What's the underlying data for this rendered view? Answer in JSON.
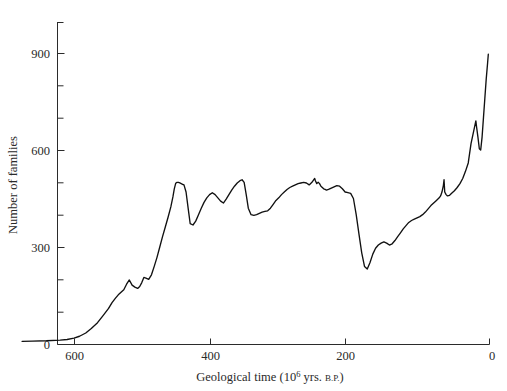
{
  "chart_data": {
    "type": "line",
    "title": "",
    "subtitle": "",
    "xlabel": "Geological time (10^6 yrs. B.P.)",
    "xlabel_main": "Geological time (10",
    "xlabel_exponent": "6",
    "xlabel_mid": " yrs. ",
    "xlabel_smallcaps": "B.P.",
    "xlabel_end": ")",
    "ylabel": "Number of families",
    "grid": false,
    "legend": null,
    "xlim": [
      680,
      0
    ],
    "ylim": [
      0,
      1000
    ],
    "x_axis_inverted": true,
    "xticks": [
      600,
      400,
      200,
      0
    ],
    "xtick_labels": [
      "600",
      "400",
      "200",
      "0"
    ],
    "x_minor_tick_interval": 0,
    "yticks": [
      0,
      300,
      600,
      900
    ],
    "ytick_labels": [
      "0",
      "300",
      "600",
      "900"
    ],
    "y_minor_ticks": [
      100,
      200,
      400,
      500,
      700,
      800,
      1000
    ],
    "series_name": "Number of marine + continental animal families",
    "x": [
      675,
      660,
      640,
      620,
      610,
      600,
      592,
      583,
      575,
      566,
      558,
      550,
      545,
      540,
      536,
      532,
      528,
      524,
      520,
      516,
      512,
      508,
      505,
      502,
      499,
      496,
      492,
      488,
      484,
      480,
      476,
      472,
      468,
      464,
      460,
      457,
      455,
      453,
      451,
      449,
      447,
      445,
      443,
      441,
      438,
      435,
      432,
      428,
      424,
      420,
      416,
      412,
      408,
      404,
      400,
      396,
      392,
      388,
      384,
      380,
      376,
      372,
      368,
      364,
      360,
      357,
      354,
      351,
      348,
      344,
      340,
      336,
      332,
      328,
      324,
      320,
      316,
      312,
      308,
      304,
      300,
      296,
      292,
      288,
      284,
      280,
      276,
      272,
      268,
      264,
      260,
      256,
      252,
      251,
      249,
      247,
      245,
      243,
      241,
      239,
      237,
      235,
      232,
      228,
      224,
      220,
      216,
      212,
      208,
      204,
      200,
      196,
      192,
      188,
      184,
      180,
      176,
      172,
      168,
      164,
      160,
      156,
      152,
      148,
      144,
      140,
      136,
      132,
      128,
      124,
      120,
      116,
      112,
      108,
      104,
      100,
      96,
      92,
      88,
      84,
      80,
      76,
      72,
      70,
      68,
      66,
      65,
      64,
      62,
      60,
      57,
      54,
      50,
      46,
      42,
      38,
      34,
      30,
      26,
      22,
      18,
      14,
      10,
      6,
      3,
      1
    ],
    "y": [
      8,
      9,
      10,
      12,
      14,
      18,
      24,
      34,
      48,
      66,
      88,
      110,
      128,
      142,
      152,
      160,
      168,
      185,
      198,
      182,
      176,
      172,
      178,
      190,
      206,
      204,
      200,
      214,
      240,
      268,
      300,
      332,
      362,
      392,
      424,
      455,
      480,
      497,
      500,
      500,
      498,
      496,
      494,
      492,
      470,
      420,
      372,
      368,
      380,
      400,
      420,
      438,
      452,
      462,
      468,
      462,
      452,
      442,
      436,
      448,
      462,
      476,
      488,
      498,
      505,
      508,
      500,
      462,
      420,
      400,
      398,
      400,
      404,
      408,
      410,
      412,
      420,
      432,
      444,
      452,
      462,
      470,
      478,
      484,
      488,
      492,
      496,
      498,
      500,
      498,
      492,
      500,
      512,
      505,
      496,
      500,
      496,
      488,
      484,
      480,
      478,
      476,
      478,
      482,
      486,
      490,
      488,
      480,
      470,
      468,
      466,
      450,
      400,
      340,
      282,
      240,
      232,
      252,
      278,
      296,
      306,
      312,
      316,
      312,
      306,
      310,
      320,
      332,
      344,
      356,
      366,
      376,
      382,
      386,
      390,
      394,
      400,
      408,
      418,
      428,
      436,
      444,
      452,
      458,
      470,
      490,
      508,
      470,
      462,
      458,
      460,
      466,
      474,
      484,
      496,
      512,
      534,
      560,
      590,
      620,
      650,
      676,
      692,
      700
    ],
    "y_late_cenozoic_x": [
      26,
      22,
      20,
      19,
      18,
      16,
      14,
      12,
      10,
      8,
      6,
      4,
      2,
      1
    ],
    "y_late_cenozoic_y": [
      620,
      660,
      680,
      690,
      672,
      640,
      604,
      600,
      640,
      700,
      760,
      820,
      870,
      896
    ],
    "annotations": [],
    "notable_features": [
      {
        "label": "Cambrian rise",
        "x_range": [
          570,
          500
        ],
        "description": "rapid increase from near zero to about 200 families"
      },
      {
        "label": "Ordovician peak",
        "x": 451,
        "y": 500
      },
      {
        "label": "end-Ordovician drop",
        "x": 432,
        "y": 370
      },
      {
        "label": "Devonian peak",
        "x": 357,
        "y": 508
      },
      {
        "label": "Late Devonian drop",
        "x": 344,
        "y": 398
      },
      {
        "label": "Permian plateau",
        "x_range": [
          280,
          250
        ],
        "y": 500
      },
      {
        "label": "end-Permian extinction",
        "x": 180,
        "y": 232
      },
      {
        "label": "Mesozoic recovery",
        "x_range": [
          175,
          70
        ],
        "description": "steady rise from about 250 to 500 families"
      },
      {
        "label": "Late Cretaceous peak",
        "x": 70,
        "y": 508
      },
      {
        "label": "Cretaceous rise",
        "x": 19,
        "y": 690
      },
      {
        "label": "end-Cretaceous drop",
        "x": 12,
        "y": 600
      },
      {
        "label": "Cenozoic maximum",
        "x": 1,
        "y": 896
      }
    ]
  },
  "plot_geometry": {
    "x_pixel_at_600": 74,
    "x_pixel_at_400": 210,
    "x_pixel_at_200": 345,
    "x_pixel_at_0": 489,
    "y_pixel_at_0": 344,
    "y_pixel_at_900": 53,
    "axis_top_pixel": 22
  },
  "colors": {
    "curve": "#111111",
    "axis": "#2b2b2b",
    "text": "#2a2a2a",
    "background": "#ffffff"
  }
}
